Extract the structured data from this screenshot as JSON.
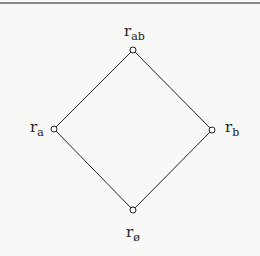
{
  "diagram": {
    "type": "lattice",
    "nodes": [
      {
        "id": "top",
        "base": "r",
        "sub": "ab",
        "x": 133,
        "y": 50
      },
      {
        "id": "left",
        "base": "r",
        "sub": "a",
        "x": 54,
        "y": 129
      },
      {
        "id": "right",
        "base": "r",
        "sub": "b",
        "x": 212,
        "y": 130
      },
      {
        "id": "bottom",
        "base": "r",
        "sub": "ø",
        "x": 133,
        "y": 210
      }
    ],
    "edges": [
      [
        "top",
        "left"
      ],
      [
        "top",
        "right"
      ],
      [
        "left",
        "bottom"
      ],
      [
        "right",
        "bottom"
      ]
    ],
    "colors": {
      "line": "#222222",
      "node_fill": "#ffffff",
      "border": "#8a8a8a"
    }
  }
}
